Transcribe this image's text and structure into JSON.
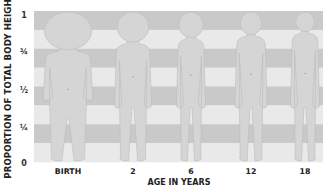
{
  "chart_data": {
    "type": "diagram",
    "title": "",
    "ylabel": "PROPORTION OF TOTAL BODY HEIGHT",
    "xlabel": "AGE IN YEARS",
    "y_ticks": [
      {
        "label": "1",
        "value": 1.0
      },
      {
        "label": "¾",
        "value": 0.75
      },
      {
        "label": "½",
        "value": 0.5
      },
      {
        "label": "¼",
        "value": 0.25
      },
      {
        "label": "0",
        "value": 0.0
      }
    ],
    "categories": [
      "BIRTH",
      "2",
      "6",
      "12",
      "18"
    ],
    "bands": 8,
    "band_colors": {
      "dark": "#c9c9c9",
      "light": "#e9e9e9"
    },
    "figure_color": "#d5d5d5",
    "figure_outline": "#bcbcbc",
    "series": [
      {
        "name": "head proportion of height (approx)",
        "values": [
          0.25,
          0.2,
          0.17,
          0.15,
          0.13
        ]
      }
    ]
  },
  "labels": {
    "ylabel": "PROPORTION OF TOTAL BODY HEIGHT",
    "xlabel": "AGE IN YEARS",
    "ticks": [
      "1",
      "¾",
      "½",
      "¼",
      "0"
    ],
    "ages": [
      "BIRTH",
      "2",
      "6",
      "12",
      "18"
    ]
  }
}
